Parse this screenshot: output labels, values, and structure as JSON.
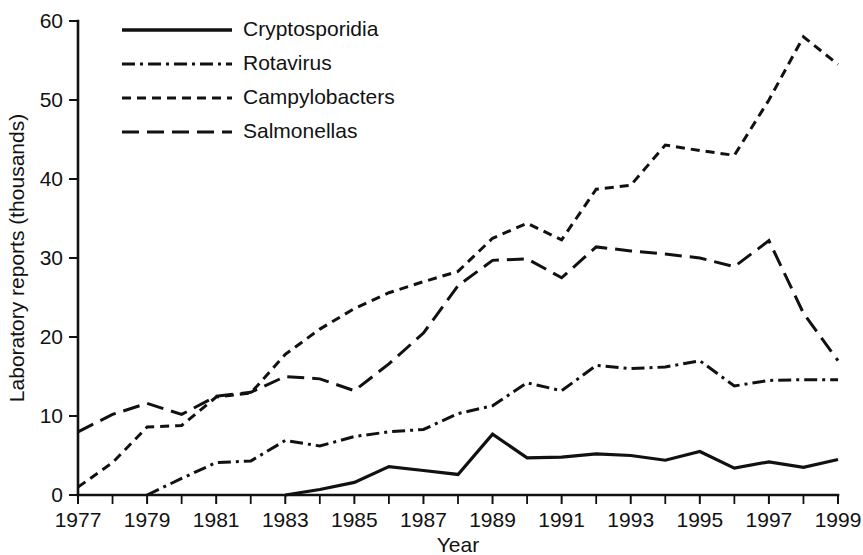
{
  "chart_data": {
    "type": "line",
    "title": "",
    "subtitle": "",
    "xlabel": "Year",
    "ylabel": "Laboratory reports (thousands)",
    "xlim": [
      1977,
      1999
    ],
    "ylim": [
      0,
      60
    ],
    "grid": false,
    "legend_position": "top-left",
    "x": [
      1977,
      1978,
      1979,
      1980,
      1981,
      1982,
      1983,
      1984,
      1985,
      1986,
      1987,
      1988,
      1989,
      1990,
      1991,
      1992,
      1993,
      1994,
      1995,
      1996,
      1997,
      1998,
      1999
    ],
    "xticks": [
      1977,
      1979,
      1981,
      1983,
      1985,
      1987,
      1989,
      1991,
      1993,
      1995,
      1997,
      1999
    ],
    "xtick_labels": [
      "1977",
      "1979",
      "1981",
      "1983",
      "1985",
      "1987",
      "1989",
      "1991",
      "1993",
      "1995",
      "1997",
      "1999"
    ],
    "xminor_ticks": [
      1978,
      1980,
      1982,
      1984,
      1986,
      1988,
      1990,
      1992,
      1994,
      1996,
      1998
    ],
    "yticks": [
      0,
      10,
      20,
      30,
      40,
      50,
      60
    ],
    "ytick_labels": [
      "0",
      "10",
      "20",
      "30",
      "40",
      "50",
      "60"
    ],
    "series": [
      {
        "name": "Cryptosporidia",
        "style": "solid",
        "dash": "",
        "width": 3.2,
        "color": "#111111",
        "x": [
          1983,
          1984,
          1985,
          1986,
          1987,
          1988,
          1989,
          1990,
          1991,
          1992,
          1993,
          1994,
          1995,
          1996,
          1997,
          1998,
          1999
        ],
        "values": [
          0.0,
          0.7,
          1.6,
          3.6,
          3.1,
          2.6,
          7.7,
          4.7,
          4.8,
          5.2,
          5.0,
          4.4,
          5.5,
          3.4,
          4.2,
          3.5,
          4.5
        ]
      },
      {
        "name": "Rotavirus",
        "style": "dash-dot",
        "dash": "13,5,3,5",
        "width": 3.0,
        "color": "#111111",
        "x": [
          1979,
          1980,
          1981,
          1982,
          1983,
          1984,
          1985,
          1986,
          1987,
          1988,
          1989,
          1990,
          1991,
          1992,
          1993,
          1994,
          1995,
          1996,
          1997,
          1998,
          1999
        ],
        "values": [
          0.0,
          2.1,
          4.1,
          4.3,
          6.9,
          6.2,
          7.4,
          8.0,
          8.3,
          10.3,
          11.3,
          14.2,
          13.2,
          16.4,
          16.0,
          16.2,
          17.0,
          13.8,
          14.5,
          14.6,
          14.6
        ]
      },
      {
        "name": "Campylobacters",
        "style": "dashed-short",
        "dash": "9,6",
        "width": 3.0,
        "color": "#111111",
        "x": [
          1977,
          1978,
          1979,
          1980,
          1981,
          1982,
          1983,
          1984,
          1985,
          1986,
          1987,
          1988,
          1989,
          1990,
          1991,
          1992,
          1993,
          1994,
          1995,
          1996,
          1997,
          1998,
          1999
        ],
        "values": [
          1.0,
          4.1,
          8.6,
          8.8,
          12.4,
          12.9,
          17.8,
          21.0,
          23.6,
          25.6,
          27.0,
          28.3,
          32.5,
          34.4,
          32.3,
          38.7,
          39.2,
          44.3,
          43.6,
          43.0,
          50.0,
          58.0,
          54.5
        ]
      },
      {
        "name": "Salmonellas",
        "style": "dashed-long",
        "dash": "17,8",
        "width": 3.0,
        "color": "#111111",
        "x": [
          1977,
          1978,
          1979,
          1980,
          1981,
          1982,
          1983,
          1984,
          1985,
          1986,
          1987,
          1988,
          1989,
          1990,
          1991,
          1992,
          1993,
          1994,
          1995,
          1996,
          1997,
          1998,
          1999
        ],
        "values": [
          8.0,
          10.2,
          11.6,
          10.2,
          12.5,
          13.0,
          15.0,
          14.7,
          13.2,
          16.6,
          20.5,
          26.5,
          29.7,
          29.9,
          27.5,
          31.4,
          30.9,
          30.5,
          30.0,
          28.9,
          32.2,
          23.0,
          17.0
        ]
      }
    ],
    "legend": [
      {
        "label": "Cryptosporidia",
        "style": "solid",
        "dash": "",
        "width": 3.4
      },
      {
        "label": "Rotavirus",
        "style": "dash-dot",
        "dash": "13,5,3,5",
        "width": 3.2
      },
      {
        "label": "Campylobacters",
        "style": "dashed-short",
        "dash": "9,6",
        "width": 3.2
      },
      {
        "label": "Salmonellas",
        "style": "dashed-long",
        "dash": "17,8",
        "width": 3.2
      }
    ]
  }
}
